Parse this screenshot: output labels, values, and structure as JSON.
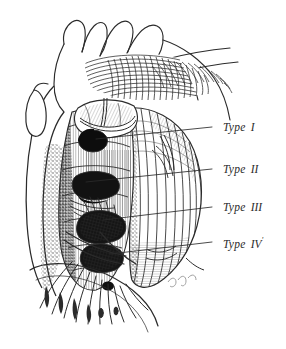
{
  "figure": {
    "background_color": "#ffffff",
    "ink_color": "#2b2b2b",
    "defect_fill_color": "#111111",
    "signature": "Dugan"
  },
  "labels": [
    {
      "id": "type-1",
      "word": "Type",
      "numeral": "I",
      "prime": "",
      "text_x": 225,
      "text_y": 129,
      "leader": {
        "x1": 96,
        "y1": 139,
        "x2": 212,
        "y2": 127
      }
    },
    {
      "id": "type-2",
      "word": "Type",
      "numeral": "II",
      "prime": "",
      "text_x": 225,
      "text_y": 171,
      "leader": {
        "x1": 86,
        "y1": 182,
        "x2": 212,
        "y2": 169
      }
    },
    {
      "id": "type-3",
      "word": "Type",
      "numeral": "III",
      "prime": "",
      "text_x": 225,
      "text_y": 209,
      "leader": {
        "x1": 103,
        "y1": 220,
        "x2": 212,
        "y2": 207
      }
    },
    {
      "id": "type-4",
      "word": "Type",
      "numeral": "IV",
      "prime": "'",
      "text_x": 225,
      "text_y": 244,
      "leader": {
        "x1": 110,
        "y1": 254,
        "x2": 212,
        "y2": 242
      }
    }
  ]
}
